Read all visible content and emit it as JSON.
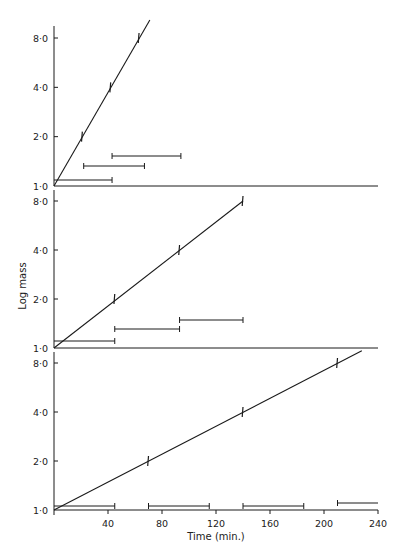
{
  "chart_data": {
    "type": "line",
    "figure": {
      "ylabel": "Log mass",
      "xlabel": "Time (min.)",
      "x_ticks": [
        40,
        80,
        120,
        160,
        200,
        240
      ],
      "xlim": [
        0,
        240
      ],
      "y_ticks": [
        1.0,
        2.0,
        4.0,
        8.0
      ],
      "y_tick_labels": [
        "1·0",
        "2·0",
        "4·0",
        "8·0"
      ],
      "y_scale": "log2",
      "panels_share_x": true
    },
    "panels": [
      {
        "name": "panel-1",
        "doubling_time_min": 21,
        "line": {
          "x": [
            0,
            71
          ],
          "y": [
            1.0,
            10.4
          ]
        },
        "points": [
          {
            "x": 21,
            "y": 2.0
          },
          {
            "x": 42,
            "y": 4.0
          },
          {
            "x": 63,
            "y": 8.0
          }
        ],
        "intervals": [
          {
            "start": 0,
            "end": 43,
            "level": 1
          },
          {
            "start": 22,
            "end": 67,
            "level": 2
          },
          {
            "start": 43,
            "end": 94,
            "level": 3
          }
        ]
      },
      {
        "name": "panel-2",
        "doubling_time_min": 47,
        "line": {
          "x": [
            0,
            140
          ],
          "y": [
            1.0,
            8.0
          ]
        },
        "points": [
          {
            "x": 45,
            "y": 2.0
          },
          {
            "x": 93,
            "y": 4.0
          },
          {
            "x": 140,
            "y": 8.0
          }
        ],
        "intervals": [
          {
            "start": 0,
            "end": 45,
            "level": 1
          },
          {
            "start": 45,
            "end": 93,
            "level": 2
          },
          {
            "start": 93,
            "end": 140,
            "level": 3
          }
        ]
      },
      {
        "name": "panel-3",
        "doubling_time_min": 70,
        "line": {
          "x": [
            0,
            228
          ],
          "y": [
            1.0,
            9.5
          ]
        },
        "points": [
          {
            "x": 70,
            "y": 2.0
          },
          {
            "x": 140,
            "y": 4.0
          },
          {
            "x": 210,
            "y": 8.0
          }
        ],
        "intervals": [
          {
            "start": 0,
            "end": 45,
            "level": 1
          },
          {
            "start": 70,
            "end": 115,
            "level": 1
          },
          {
            "start": 140,
            "end": 185,
            "level": 1
          },
          {
            "start": 210,
            "end": 240,
            "level": 2
          }
        ]
      }
    ]
  },
  "layout": {
    "x0_px": 54,
    "px_per_min": 1.35,
    "x_end_px": 378,
    "panel_px": [
      {
        "y1": 186,
        "y8": 38,
        "axis_top": 26,
        "axis_right": 378,
        "bar_y": [
          180,
          166,
          156
        ]
      },
      {
        "y1": 348,
        "y8": 201,
        "axis_top": 190,
        "axis_right": 378,
        "bar_y": [
          341,
          329,
          320
        ]
      },
      {
        "y1": 510,
        "y8": 363,
        "axis_top": 352,
        "axis_right": 378,
        "bar_y": [
          506,
          503
        ]
      }
    ],
    "ink": "#1a1a1a"
  }
}
